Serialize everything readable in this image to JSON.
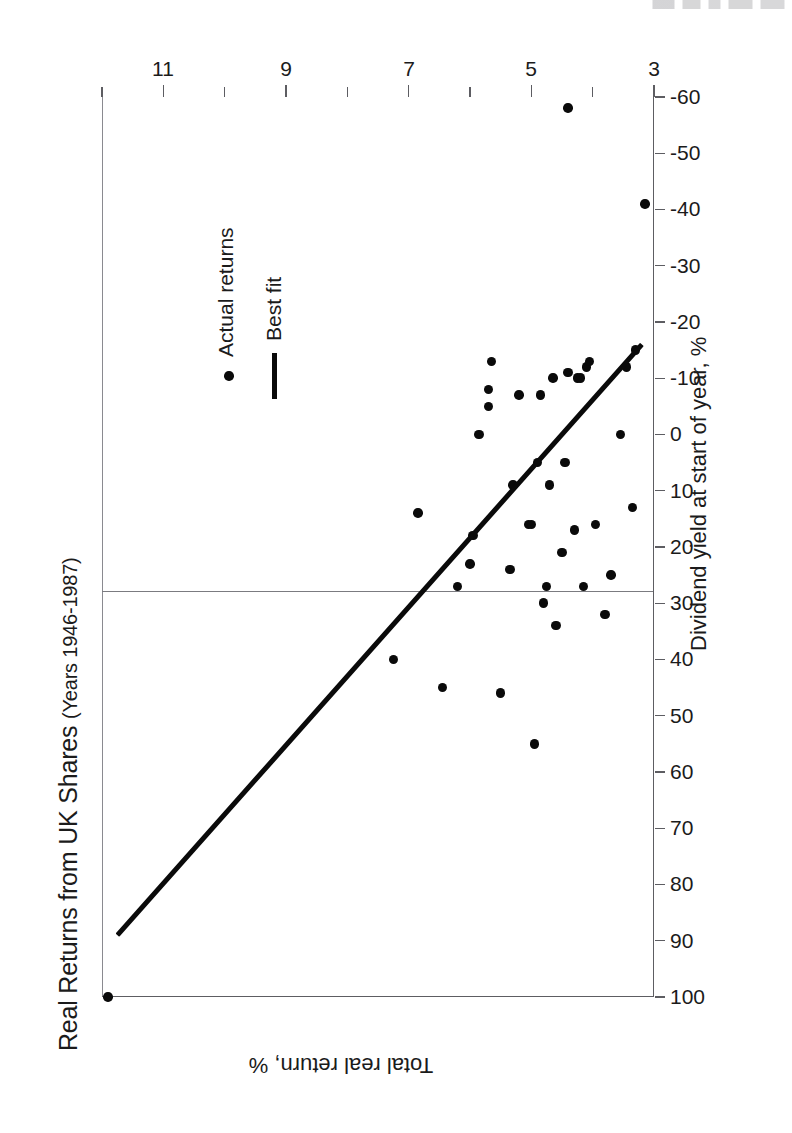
{
  "figure": {
    "title_main": "Real Returns from UK Shares ",
    "title_sub": "(Years 1946-1987)",
    "orientation": "rotated-90-ccw",
    "paper_color": "#ffffff",
    "ink_color": "#0a0a0a",
    "axis_color": "#5d5d62"
  },
  "legend": {
    "position": "upper-right",
    "items": [
      {
        "label": "Actual returns",
        "marker": "dot",
        "color": "#0a0a0a"
      },
      {
        "label": "Best fit",
        "marker": "line",
        "color": "#0a0a0a"
      }
    ]
  },
  "chart_data": {
    "type": "scatter",
    "title": "Real Returns from UK Shares (Years 1946-1987)",
    "subtitle": "(Years 1946-1987)",
    "xlabel": "Dividend yield at start of year, %",
    "ylabel": "Total real return, %",
    "xlim": [
      3,
      12
    ],
    "ylim": [
      -60,
      100
    ],
    "grid": false,
    "legend_position": "upper-right",
    "x_ticks": [
      3,
      4,
      5,
      6,
      7,
      8,
      9,
      10,
      11,
      12
    ],
    "x_tick_labels": [
      "3",
      "",
      "5",
      "",
      "7",
      "",
      "9",
      "",
      "11",
      ""
    ],
    "y_ticks": [
      100,
      90,
      80,
      70,
      60,
      50,
      40,
      30,
      20,
      10,
      0,
      -10,
      -20,
      -30,
      -40,
      -50,
      -60
    ],
    "y_tick_labels": [
      "100",
      "90",
      "80",
      "70",
      "60",
      "50",
      "40",
      "30",
      "20",
      "10",
      "0",
      "-10",
      "-20",
      "-30",
      "-40",
      "-50",
      "-60"
    ],
    "series": [
      {
        "name": "Actual returns",
        "marker": "dot",
        "color": "#0a0a0a",
        "points": [
          {
            "x": 11.9,
            "y": 100
          },
          {
            "x": 7.25,
            "y": 40
          },
          {
            "x": 6.85,
            "y": 14
          },
          {
            "x": 6.45,
            "y": 45
          },
          {
            "x": 6.2,
            "y": 27
          },
          {
            "x": 6.0,
            "y": 23
          },
          {
            "x": 5.95,
            "y": 18
          },
          {
            "x": 5.85,
            "y": 0
          },
          {
            "x": 5.7,
            "y": -5
          },
          {
            "x": 5.7,
            "y": -8
          },
          {
            "x": 5.65,
            "y": -13
          },
          {
            "x": 5.5,
            "y": 46
          },
          {
            "x": 5.35,
            "y": 24
          },
          {
            "x": 5.3,
            "y": 9
          },
          {
            "x": 5.2,
            "y": -7
          },
          {
            "x": 5.05,
            "y": 16
          },
          {
            "x": 5.0,
            "y": 16
          },
          {
            "x": 4.95,
            "y": 55
          },
          {
            "x": 4.9,
            "y": 5
          },
          {
            "x": 4.85,
            "y": -7
          },
          {
            "x": 4.8,
            "y": 30
          },
          {
            "x": 4.75,
            "y": 27
          },
          {
            "x": 4.7,
            "y": 9
          },
          {
            "x": 4.65,
            "y": -10
          },
          {
            "x": 4.6,
            "y": 34
          },
          {
            "x": 4.5,
            "y": 21
          },
          {
            "x": 4.45,
            "y": 5
          },
          {
            "x": 4.4,
            "y": -11
          },
          {
            "x": 4.3,
            "y": 17
          },
          {
            "x": 4.25,
            "y": -10
          },
          {
            "x": 4.2,
            "y": -10
          },
          {
            "x": 4.15,
            "y": 27
          },
          {
            "x": 4.1,
            "y": -12
          },
          {
            "x": 4.05,
            "y": -13
          },
          {
            "x": 3.95,
            "y": 16
          },
          {
            "x": 3.8,
            "y": 32
          },
          {
            "x": 3.7,
            "y": 25
          },
          {
            "x": 3.55,
            "y": 0
          },
          {
            "x": 3.45,
            "y": -12
          },
          {
            "x": 3.35,
            "y": 13
          },
          {
            "x": 3.3,
            "y": -15
          },
          {
            "x": 3.15,
            "y": -41
          },
          {
            "x": 4.4,
            "y": -58
          }
        ]
      },
      {
        "name": "Best fit",
        "marker": "line",
        "color": "#0a0a0a",
        "line_endpoints": [
          {
            "x": 11.75,
            "y": 89
          },
          {
            "x": 3.2,
            "y": -16
          }
        ],
        "description": "Downward-sloping best fit line: higher dividend yield at start of year associates with higher subsequent total real return."
      }
    ]
  }
}
